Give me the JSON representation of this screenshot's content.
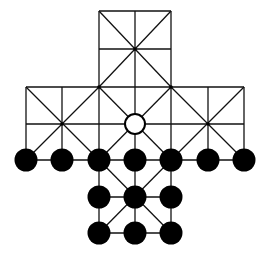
{
  "game": {
    "name": "cross-board-hunt-game",
    "colors": {
      "line": "#111111",
      "piece": "#000000",
      "empty": "#ffffff"
    },
    "grid": {
      "cols_x": [
        26,
        62,
        99,
        135,
        171,
        208,
        244
      ],
      "rows_y": [
        11,
        49,
        87,
        124,
        160,
        197,
        233
      ]
    },
    "lines": [
      [
        3,
        0,
        5,
        0
      ],
      [
        3,
        1,
        5,
        1
      ],
      [
        1,
        2,
        5,
        2
      ],
      [
        0,
        2,
        6,
        2
      ],
      [
        0,
        3,
        6,
        3
      ],
      [
        0,
        4,
        6,
        4
      ],
      [
        2,
        5,
        4,
        5
      ],
      [
        2,
        6,
        4,
        6
      ],
      [
        2,
        0,
        2,
        6
      ],
      [
        3,
        0,
        3,
        6
      ],
      [
        4,
        0,
        4,
        6
      ],
      [
        0,
        2,
        0,
        4
      ],
      [
        1,
        2,
        1,
        4
      ],
      [
        5,
        2,
        5,
        4
      ],
      [
        6,
        2,
        6,
        4
      ],
      [
        2,
        0,
        4,
        2
      ],
      [
        4,
        0,
        2,
        2
      ],
      [
        2,
        2,
        6,
        6
      ],
      [
        4,
        2,
        2,
        4
      ],
      [
        0,
        2,
        2,
        4
      ],
      [
        2,
        2,
        0,
        4
      ],
      [
        4,
        2,
        6,
        4
      ],
      [
        6,
        2,
        4,
        4
      ],
      [
        2,
        4,
        4,
        6
      ],
      [
        4,
        4,
        2,
        6
      ],
      [
        0,
        4,
        0,
        4
      ]
    ],
    "pieces": [
      {
        "col": 0,
        "row": 4,
        "type": "black"
      },
      {
        "col": 1,
        "row": 4,
        "type": "black"
      },
      {
        "col": 2,
        "row": 4,
        "type": "black"
      },
      {
        "col": 3,
        "row": 4,
        "type": "black"
      },
      {
        "col": 4,
        "row": 4,
        "type": "black"
      },
      {
        "col": 5,
        "row": 4,
        "type": "black"
      },
      {
        "col": 6,
        "row": 4,
        "type": "black"
      },
      {
        "col": 2,
        "row": 5,
        "type": "black"
      },
      {
        "col": 3,
        "row": 5,
        "type": "black"
      },
      {
        "col": 4,
        "row": 5,
        "type": "black"
      },
      {
        "col": 2,
        "row": 6,
        "type": "black"
      },
      {
        "col": 3,
        "row": 6,
        "type": "black"
      },
      {
        "col": 4,
        "row": 6,
        "type": "black"
      },
      {
        "col": 3,
        "row": 3,
        "type": "empty"
      }
    ],
    "intersection_dots": [
      [
        3,
        1
      ],
      [
        2,
        2
      ],
      [
        4,
        2
      ],
      [
        1,
        3
      ],
      [
        5,
        3
      ]
    ]
  }
}
